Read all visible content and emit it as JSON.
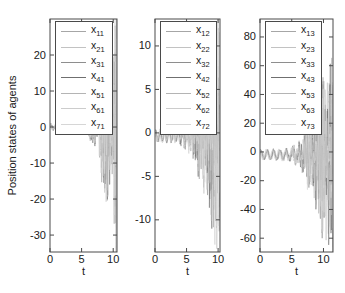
{
  "figure": {
    "background": "#ffffff",
    "axis_color": "#4a4a4a",
    "text_color": "#202020",
    "tick_font_size": 11,
    "series_palette": [
      "#a6a6a6",
      "#c2c2c2",
      "#8e8e8e",
      "#6f6f6f",
      "#b4b4b4",
      "#cccccc",
      "#d6d6d6"
    ]
  },
  "chart_data": [
    {
      "type": "line",
      "title": "",
      "xlabel": "t",
      "ylabel": "Position states of agents",
      "xlim": [
        0,
        10.6
      ],
      "xticks": [
        0,
        5,
        10
      ],
      "ylim": [
        -34.7,
        30
      ],
      "yticks": [
        20,
        10,
        0,
        -10,
        -20,
        -30
      ],
      "grid": false,
      "legend_position": "northwest",
      "series": [
        {
          "base": "x",
          "sub": "11",
          "color": "#a6a6a6"
        },
        {
          "base": "x",
          "sub": "21",
          "color": "#c2c2c2"
        },
        {
          "base": "x",
          "sub": "31",
          "color": "#8e8e8e"
        },
        {
          "base": "x",
          "sub": "41",
          "color": "#6f6f6f"
        },
        {
          "base": "x",
          "sub": "51",
          "color": "#b4b4b4"
        },
        {
          "base": "x",
          "sub": "61",
          "color": "#cccccc"
        },
        {
          "base": "x",
          "sub": "71",
          "color": "#d6d6d6"
        }
      ],
      "series_model": {
        "description": "seven overlapping oscillations, near zero until t~6 then diverging",
        "base_wave": {
          "amplitude": 0.6,
          "frequency": 1.2,
          "offset": 0
        },
        "noise_frequency_range": [
          2.4,
          3.4
        ],
        "envelope_t": [
          0,
          5,
          6,
          7,
          8,
          9,
          10,
          10.6
        ],
        "envelope_amp": [
          0.5,
          0.7,
          1.6,
          5,
          11,
          18,
          26,
          31
        ]
      }
    },
    {
      "type": "line",
      "title": "",
      "xlabel": "t",
      "ylabel": "",
      "xlim": [
        0,
        10.3
      ],
      "xticks": [
        0,
        5,
        10
      ],
      "ylim": [
        -13.7,
        13.1
      ],
      "yticks": [
        10,
        5,
        0,
        -5,
        -10
      ],
      "grid": false,
      "legend_position": "northwest",
      "series": [
        {
          "base": "x",
          "sub": "12",
          "color": "#a6a6a6"
        },
        {
          "base": "x",
          "sub": "22",
          "color": "#c2c2c2"
        },
        {
          "base": "x",
          "sub": "32",
          "color": "#8e8e8e"
        },
        {
          "base": "x",
          "sub": "42",
          "color": "#6f6f6f"
        },
        {
          "base": "x",
          "sub": "52",
          "color": "#b4b4b4"
        },
        {
          "base": "x",
          "sub": "62",
          "color": "#cccccc"
        },
        {
          "base": "x",
          "sub": "72",
          "color": "#d6d6d6"
        }
      ],
      "series_model": {
        "description": "small regular wave near zero, growing oscillation bursts after t~5",
        "base_wave": {
          "amplitude": 0.55,
          "frequency": 1.4,
          "offset": -0.35
        },
        "noise_frequency_range": [
          2.4,
          3.4
        ],
        "envelope_t": [
          0,
          3.5,
          5,
          6,
          7,
          8,
          9,
          10,
          10.3
        ],
        "envelope_amp": [
          0.2,
          0.35,
          1,
          2.2,
          3.8,
          6,
          8.5,
          11.5,
          13
        ]
      }
    },
    {
      "type": "line",
      "title": "",
      "xlabel": "t",
      "ylabel": "",
      "xlim": [
        0,
        11.5
      ],
      "xticks": [
        0,
        5,
        10
      ],
      "ylim": [
        -69.6,
        92.5
      ],
      "yticks": [
        80,
        60,
        40,
        20,
        0,
        -20,
        -40,
        -60
      ],
      "grid": false,
      "legend_position": "northwest",
      "series": [
        {
          "base": "x",
          "sub": "13",
          "color": "#a6a6a6"
        },
        {
          "base": "x",
          "sub": "23",
          "color": "#c2c2c2"
        },
        {
          "base": "x",
          "sub": "33",
          "color": "#8e8e8e"
        },
        {
          "base": "x",
          "sub": "43",
          "color": "#6f6f6f"
        },
        {
          "base": "x",
          "sub": "53",
          "color": "#b4b4b4"
        },
        {
          "base": "x",
          "sub": "63",
          "color": "#cccccc"
        },
        {
          "base": "x",
          "sub": "73",
          "color": "#d6d6d6"
        }
      ],
      "series_model": {
        "description": "wave of amplitude ~3 around -2, diverging after t~6 up to ~+60/-65",
        "base_wave": {
          "amplitude": 3,
          "frequency": 1.0,
          "offset": -2
        },
        "noise_frequency_range": [
          2.4,
          3.4
        ],
        "envelope_t": [
          0,
          3,
          5,
          6,
          7,
          8,
          9,
          10,
          11,
          11.5
        ],
        "envelope_amp": [
          0.8,
          1.2,
          2.5,
          6,
          12,
          22,
          35,
          48,
          58,
          64
        ]
      }
    }
  ]
}
